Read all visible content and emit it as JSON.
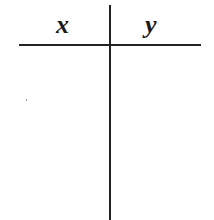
{
  "t_chart": {
    "columns": [
      {
        "key": "x",
        "label": "x"
      },
      {
        "key": "y",
        "label": "y"
      }
    ],
    "rows": [],
    "line_color": "#222222",
    "text_color": "#1a1a1a"
  }
}
